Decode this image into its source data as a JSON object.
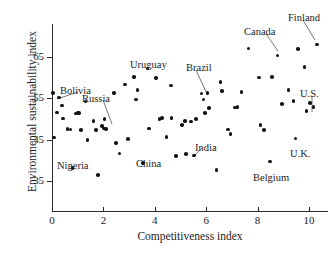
{
  "chart_data": {
    "type": "scatter",
    "title": "",
    "xlabel": "Competitiveness index",
    "ylabel": "Environmental sustainability index",
    "xlim": [
      -0.35,
      10.75
    ],
    "ylim": [
      30.5,
      70.5
    ],
    "xticks": [
      0,
      2,
      4,
      6,
      8,
      10
    ],
    "xticklabels": [
      "0",
      "2",
      "4",
      "6",
      "8",
      "10"
    ],
    "yticks": [
      35,
      45,
      55,
      65
    ],
    "yticklabels": [
      "35",
      "45",
      "55",
      "65"
    ],
    "grid": false,
    "legend": null,
    "marker": "filled-circle",
    "marker_color": "#121212",
    "points": [
      [
        0.05,
        56.3
      ],
      [
        0.08,
        45.5
      ],
      [
        0.2,
        51.6
      ],
      [
        0.28,
        55.2
      ],
      [
        0.38,
        53.3
      ],
      [
        0.42,
        50.1
      ],
      [
        0.6,
        47.6
      ],
      [
        0.72,
        47.5
      ],
      [
        0.8,
        38.1
      ],
      [
        0.92,
        51.3
      ],
      [
        1.0,
        51.4
      ],
      [
        1.05,
        51.4
      ],
      [
        1.12,
        47.3
      ],
      [
        1.3,
        54.2
      ],
      [
        1.38,
        44.9
      ],
      [
        1.62,
        49.5
      ],
      [
        1.72,
        47.4
      ],
      [
        1.8,
        36.5
      ],
      [
        1.95,
        48.3
      ],
      [
        2.02,
        47.7
      ],
      [
        2.05,
        50.0
      ],
      [
        2.1,
        47.6
      ],
      [
        2.42,
        56.3
      ],
      [
        2.5,
        44.2
      ],
      [
        2.62,
        41.7
      ],
      [
        2.85,
        58.3
      ],
      [
        2.95,
        45.1
      ],
      [
        3.2,
        60.1
      ],
      [
        3.28,
        54.7
      ],
      [
        3.32,
        57.0
      ],
      [
        3.55,
        39.3
      ],
      [
        3.72,
        62.2
      ],
      [
        3.78,
        47.7
      ],
      [
        4.05,
        59.9
      ],
      [
        4.18,
        50.0
      ],
      [
        4.28,
        50.2
      ],
      [
        4.45,
        45.6
      ],
      [
        4.62,
        58.1
      ],
      [
        4.65,
        50.2
      ],
      [
        4.82,
        41.0
      ],
      [
        5.05,
        48.5
      ],
      [
        5.18,
        49.5
      ],
      [
        5.22,
        41.5
      ],
      [
        5.42,
        49.4
      ],
      [
        5.52,
        41.2
      ],
      [
        5.6,
        50.0
      ],
      [
        5.82,
        56.2
      ],
      [
        5.9,
        54.7
      ],
      [
        5.95,
        51.5
      ],
      [
        6.05,
        56.3
      ],
      [
        6.12,
        52.7
      ],
      [
        6.4,
        37.6
      ],
      [
        6.55,
        59.0
      ],
      [
        6.62,
        56.8
      ],
      [
        6.85,
        47.5
      ],
      [
        6.95,
        46.3
      ],
      [
        7.12,
        52.8
      ],
      [
        7.22,
        52.9
      ],
      [
        7.38,
        56.6
      ],
      [
        7.65,
        67.1
      ],
      [
        8.05,
        60.0
      ],
      [
        8.12,
        48.6
      ],
      [
        8.25,
        47.4
      ],
      [
        8.48,
        39.7
      ],
      [
        8.55,
        60.1
      ],
      [
        8.78,
        65.4
      ],
      [
        8.95,
        53.6
      ],
      [
        9.2,
        57.0
      ],
      [
        9.4,
        54.4
      ],
      [
        9.48,
        45.3
      ],
      [
        9.58,
        67.0
      ],
      [
        9.82,
        62.6
      ],
      [
        9.9,
        51.9
      ],
      [
        10.05,
        53.9
      ],
      [
        10.18,
        52.9
      ],
      [
        10.3,
        68.0
      ]
    ],
    "annotations": [
      {
        "label": "Bolivia",
        "text_x": 60,
        "text_y": 85,
        "leader": [
          78,
          92,
          57,
          99
        ]
      },
      {
        "label": "Russia",
        "text_x": 82,
        "text_y": 93,
        "leader": [
          103,
          100,
          112,
          124
        ]
      },
      {
        "label": "Nigeria",
        "text_x": 57,
        "text_y": 160,
        "leader": null
      },
      {
        "label": "Uruguay",
        "text_x": 130,
        "text_y": 59,
        "leader": null
      },
      {
        "label": "China",
        "text_x": 136,
        "text_y": 158,
        "leader": null
      },
      {
        "label": "Brazil",
        "text_x": 186,
        "text_y": 62,
        "leader": [
          196,
          70,
          207,
          94
        ]
      },
      {
        "label": "India",
        "text_x": 195,
        "text_y": 142,
        "leader": [
          202,
          148,
          193,
          157
        ]
      },
      {
        "label": "Canada",
        "text_x": 244,
        "text_y": 26,
        "leader": [
          266,
          34,
          278,
          51
        ]
      },
      {
        "label": "Finland",
        "text_x": 288,
        "text_y": 12,
        "leader": [
          303,
          20,
          315,
          40
        ]
      },
      {
        "label": "U.S.",
        "text_x": 300,
        "text_y": 88,
        "leader": [
          312,
          96,
          312,
          112
        ]
      },
      {
        "label": "U.K.",
        "text_x": 290,
        "text_y": 148,
        "leader": null
      },
      {
        "label": "Belgium",
        "text_x": 253,
        "text_y": 172,
        "leader": null
      }
    ]
  }
}
